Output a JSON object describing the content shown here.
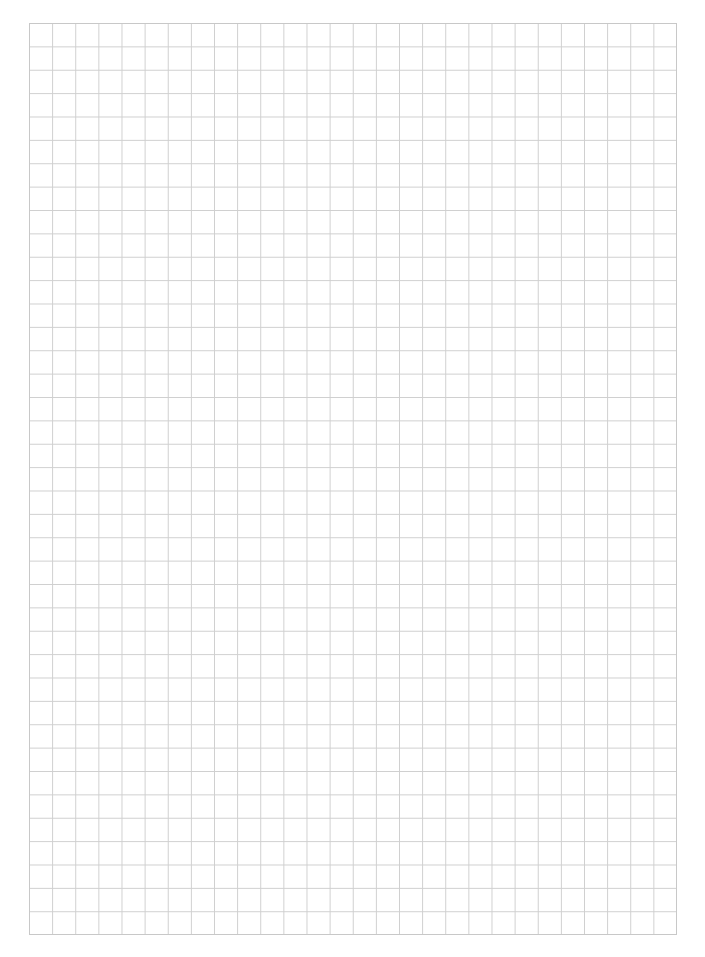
{
  "page": {
    "type": "grid-paper",
    "columns": 28,
    "rows": 39,
    "line_color": "#cfcfcf",
    "background_color": "#ffffff"
  }
}
